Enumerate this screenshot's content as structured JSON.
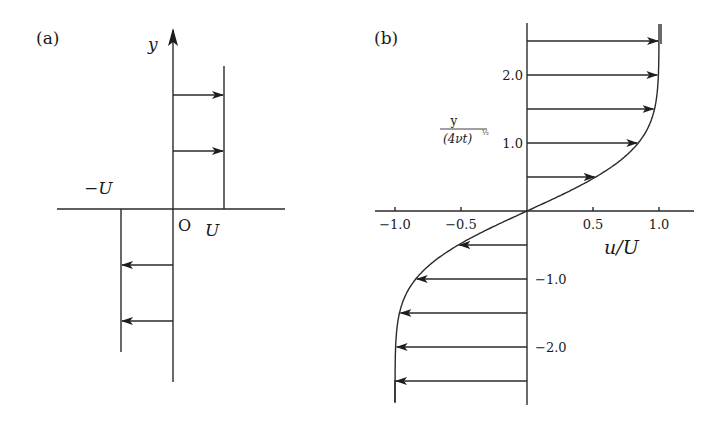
{
  "panel_a": {
    "label": "(a)",
    "y_axis_label": "y",
    "origin_label": "O",
    "pos_label": "U",
    "neg_label": "−U",
    "arrows_upper_count": 2,
    "arrows_lower_count": 2
  },
  "panel_b": {
    "label": "(b)",
    "x_axis_label": "u/U",
    "y_axis_label_num": "y",
    "y_axis_label_den": "(4νt)",
    "y_axis_label_exp": "½",
    "x_ticks": [
      "−1.0",
      "−0.5",
      "0.5",
      "1.0"
    ],
    "x_tick_values": [
      -1.0,
      -0.5,
      0.5,
      1.0
    ],
    "y_ticks": [
      "2.0",
      "1.0",
      "−1.0",
      "−2.0"
    ],
    "y_tick_values": [
      2.0,
      1.0,
      -1.0,
      -2.0
    ]
  },
  "chart_data": {
    "type": "line",
    "xlabel": "u/U",
    "ylabel": "y/(4νt)^½",
    "xlim": [
      -1.2,
      1.25
    ],
    "ylim": [
      -2.85,
      2.75
    ],
    "arrow_eta": [
      2.5,
      2.0,
      1.5,
      1.0,
      0.5,
      -0.5,
      -1.0,
      -1.5,
      -2.0,
      -2.5
    ],
    "arrow_u": [
      1.0,
      0.995,
      0.966,
      0.843,
      0.52,
      -0.52,
      -0.843,
      -0.966,
      -0.995,
      -1.0
    ]
  },
  "colors": {
    "ink": "#2a2a2a",
    "background": "#ffffff"
  }
}
